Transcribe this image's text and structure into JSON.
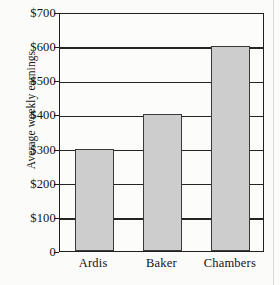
{
  "chart_data": {
    "type": "bar",
    "title": "",
    "xlabel": "",
    "ylabel": "Average weekly earnings",
    "categories": [
      "Ardis",
      "Baker",
      "Chambers"
    ],
    "values": [
      300,
      400,
      600
    ],
    "value_prefix": "$",
    "ylim": [
      0,
      700
    ],
    "ytick_values": [
      0,
      100,
      200,
      300,
      400,
      500,
      600,
      700
    ],
    "ytick_labels": [
      "0",
      "$100",
      "$200",
      "$300",
      "$400",
      "$500",
      "$600",
      "$700"
    ],
    "grid": true,
    "grid_axis": "y",
    "legend": false,
    "legend_position": "none",
    "bar_fill_color": "#cdcdcd",
    "bar_edge_color": "#3a3a3a",
    "grid_color": "#242424",
    "axis_color": "#202020",
    "background_color": "#fbfbfa",
    "text_color": "#121212"
  }
}
